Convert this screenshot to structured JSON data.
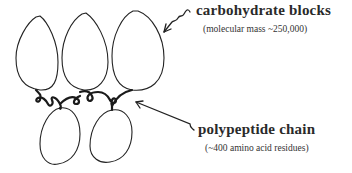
{
  "labels": {
    "carbohydrate": {
      "title": "carbohydrate blocks",
      "subtitle": "(molecular mass ~250,000)"
    },
    "polypeptide": {
      "title": "polypeptide chain",
      "subtitle": "(~400 amino acid residues)"
    }
  },
  "colors": {
    "stroke": "#222222",
    "text": "#2a2a2a",
    "background": "#ffffff"
  }
}
